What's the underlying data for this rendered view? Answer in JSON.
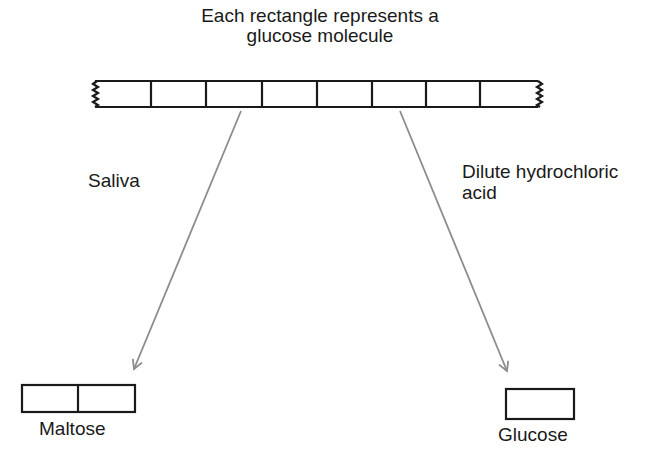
{
  "diagram": {
    "title_line1": "Each rectangle represents a",
    "title_line2": "glucose molecule",
    "left_pathway": {
      "reagent": "Saliva",
      "product": "Maltose",
      "product_units": 2
    },
    "right_pathway": {
      "reagent_line1": "Dilute hydrochloric",
      "reagent_line2": "acid",
      "product": "Glucose",
      "product_units": 1
    },
    "starch_chain": {
      "visible_units": 8,
      "ends": "broken (zigzag) — chain continues"
    },
    "colors": {
      "outline": "#1a1a1a",
      "arrow": "#8c8c8c",
      "background": "#ffffff"
    }
  }
}
